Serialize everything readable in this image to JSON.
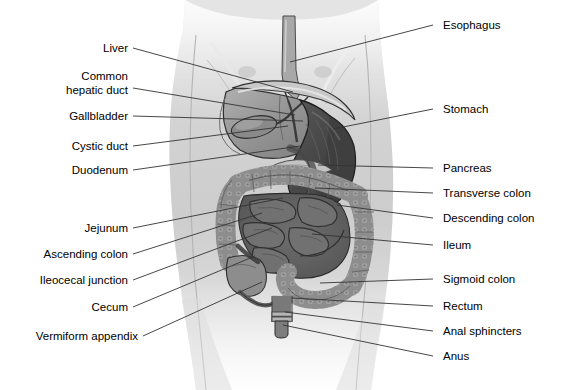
{
  "figure": {
    "width": 567,
    "height": 390,
    "background_color": "#ffffff",
    "style": "grayscale medical illustration, anterior view of torso"
  },
  "palette": {
    "background": "#ffffff",
    "body_silhouette": "#c9c9c9",
    "body_silhouette_light": "#e2e2e2",
    "liver": "#9a9a9a",
    "liver_shadow": "#7e7e7e",
    "stomach": "#4f4f4f",
    "stomach_dark": "#3b3b3b",
    "small_intestine": "#636363",
    "large_intestine": "#8b8b8b",
    "pancreas": "#bdbdbd",
    "esophagus": "#a5a5a5",
    "rectum": "#767676",
    "outline": "#2b2b2b",
    "leader_line": "#333333",
    "text": "#000000"
  },
  "labels": {
    "left": [
      {
        "id": "liver",
        "text": "Liver",
        "text_x": 128,
        "text_y": 52,
        "line_to_x": 293,
        "line_to_y": 92
      },
      {
        "id": "common-hepatic-duct",
        "text": "Common",
        "text2": "hepatic duct",
        "text_x": 128,
        "text_y": 80,
        "line_to_x": 295,
        "line_to_y": 115
      },
      {
        "id": "gallbladder",
        "text": "Gallbladder",
        "text_x": 128,
        "text_y": 120,
        "line_to_x": 303,
        "line_to_y": 121
      },
      {
        "id": "cystic-duct",
        "text": "Cystic duct",
        "text_x": 128,
        "text_y": 150,
        "line_to_x": 288,
        "line_to_y": 126
      },
      {
        "id": "duodenum",
        "text": "Duodenum",
        "text_x": 128,
        "text_y": 174,
        "line_to_x": 300,
        "line_to_y": 146
      },
      {
        "id": "jejunum",
        "text": "Jejunum",
        "text_x": 128,
        "text_y": 232,
        "line_to_x": 283,
        "line_to_y": 198
      },
      {
        "id": "ascending-colon",
        "text": "Ascending colon",
        "text_x": 128,
        "text_y": 258,
        "line_to_x": 262,
        "line_to_y": 213
      },
      {
        "id": "ileocecal-junction",
        "text": "Ileocecal junction",
        "text_x": 128,
        "text_y": 284,
        "line_to_x": 272,
        "line_to_y": 228
      },
      {
        "id": "cecum",
        "text": "Cecum",
        "text_x": 128,
        "text_y": 311,
        "line_to_x": 255,
        "line_to_y": 256
      },
      {
        "id": "vermiform-appendix",
        "text": "Vermiform appendix",
        "text_x": 138,
        "text_y": 340,
        "line_to_x": 262,
        "line_to_y": 282
      }
    ],
    "right": [
      {
        "id": "esophagus",
        "text": "Esophagus",
        "text_x": 443,
        "text_y": 29,
        "line_to_x": 290,
        "line_to_y": 62
      },
      {
        "id": "stomach",
        "text": "Stomach",
        "text_x": 443,
        "text_y": 113,
        "line_to_x": 333,
        "line_to_y": 129
      },
      {
        "id": "pancreas",
        "text": "Pancreas",
        "text_x": 443,
        "text_y": 172,
        "line_to_x": 318,
        "line_to_y": 165
      },
      {
        "id": "transverse-colon",
        "text": "Transverse colon",
        "text_x": 443,
        "text_y": 197,
        "line_to_x": 315,
        "line_to_y": 188
      },
      {
        "id": "descending-colon",
        "text": "Descending colon",
        "text_x": 443,
        "text_y": 222,
        "line_to_x": 337,
        "line_to_y": 205
      },
      {
        "id": "ileum",
        "text": "Ileum",
        "text_x": 443,
        "text_y": 249,
        "line_to_x": 312,
        "line_to_y": 234
      },
      {
        "id": "sigmoid-colon",
        "text": "Sigmoid colon",
        "text_x": 443,
        "text_y": 283,
        "line_to_x": 320,
        "line_to_y": 283
      },
      {
        "id": "rectum",
        "text": "Rectum",
        "text_x": 443,
        "text_y": 310,
        "line_to_x": 292,
        "line_to_y": 298
      },
      {
        "id": "anal-sphincters",
        "text": "Anal sphincters",
        "text_x": 443,
        "text_y": 335,
        "line_to_x": 285,
        "line_to_y": 312
      },
      {
        "id": "anus",
        "text": "Anus",
        "text_x": 443,
        "text_y": 360,
        "line_to_x": 283,
        "line_to_y": 325
      }
    ]
  }
}
